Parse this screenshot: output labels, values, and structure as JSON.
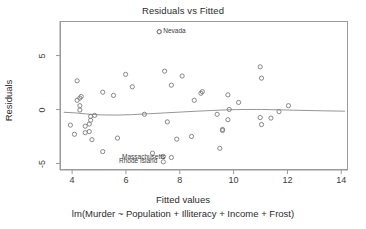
{
  "plot": {
    "title": "Residuals vs Fitted",
    "xlab": "Fitted values",
    "sub": "lm(Murder ~ Population + Illiteracy + Income + Frost)",
    "ylab": "Residuals",
    "point_color": "#7a7a7a",
    "line_color": "#8a8a8a",
    "frame_color": "#9a9a9a",
    "text_color": "#2b2b2b"
  },
  "chart_data": {
    "type": "scatter",
    "title": "Residuals vs Fitted",
    "xlabel": "Fitted values",
    "ylabel": "Residuals",
    "subtitle": "lm(Murder ~ Population + Illiteracy + Income + Frost)",
    "xlim": [
      3.55,
      14.25
    ],
    "ylim": [
      -5.6,
      8.2
    ],
    "xticks": [
      4,
      6,
      8,
      10,
      12,
      14
    ],
    "yticks": [
      5,
      0,
      -5
    ],
    "grid": false,
    "legend": null,
    "x": [
      11.0,
      9.55,
      9.75,
      9.45,
      10.95,
      5.65,
      4.15,
      7.4,
      10.95,
      10.15,
      4.25,
      4.8,
      7.35,
      7.85,
      4.6,
      4.6,
      9.35,
      12.0,
      4.05,
      8.5,
      6.95,
      8.8,
      4.45,
      11.35,
      6.65,
      4.45,
      5.1,
      11.0,
      4.3,
      7.5,
      8.05,
      8.75,
      9.8,
      5.1,
      4.65,
      4.25,
      7.65,
      7.2,
      9.75,
      6.2,
      4.25,
      9.55,
      11.65,
      5.5,
      4.15,
      8.4,
      4.7,
      5.95,
      4.65,
      3.9
    ],
    "y": [
      3.0,
      -1.75,
      1.45,
      -3.5,
      4.05,
      -2.55,
      0.95,
      3.65,
      -0.65,
      0.75,
      1.15,
      -0.45,
      -4.25,
      -2.65,
      -1.25,
      -1.95,
      -0.35,
      0.45,
      -2.2,
      0.95,
      -3.95,
      1.75,
      -1.45,
      -0.7,
      -0.35,
      -2.05,
      1.7,
      -1.3,
      1.3,
      -1.05,
      3.2,
      1.6,
      0.1,
      -3.8,
      -0.55,
      0.05,
      2.35,
      7.3,
      -0.85,
      2.2,
      0.45,
      -1.85,
      -0.1,
      1.4,
      2.75,
      -2.4,
      -2.7,
      3.35,
      -0.9,
      -1.35
    ],
    "labeled_points": [
      {
        "label": "Nevada",
        "x": 7.2,
        "y": 7.3,
        "anchor": "right"
      },
      {
        "label": "Massachusetts",
        "x": 7.65,
        "y": -4.35,
        "anchor": "left"
      },
      {
        "label": "Rhode Island",
        "x": 7.35,
        "y": -4.75,
        "anchor": "left"
      }
    ],
    "loess_curve": {
      "x": [
        3.65,
        4.1,
        4.5,
        5.0,
        5.6,
        6.2,
        6.8,
        7.4,
        8.0,
        8.6,
        9.2,
        9.8,
        10.4,
        11.0,
        11.6,
        12.2,
        12.8,
        13.4,
        14.1
      ],
      "y": [
        -0.16,
        -0.22,
        -0.32,
        -0.4,
        -0.42,
        -0.38,
        -0.3,
        -0.22,
        -0.14,
        -0.06,
        0.01,
        0.07,
        0.1,
        0.1,
        0.07,
        0.03,
        0.0,
        -0.03,
        -0.06
      ]
    }
  },
  "axis": {
    "x_tick_labels": [
      "4",
      "6",
      "8",
      "10",
      "12",
      "14"
    ],
    "y_tick_labels": [
      "5",
      "0",
      "-5"
    ]
  }
}
